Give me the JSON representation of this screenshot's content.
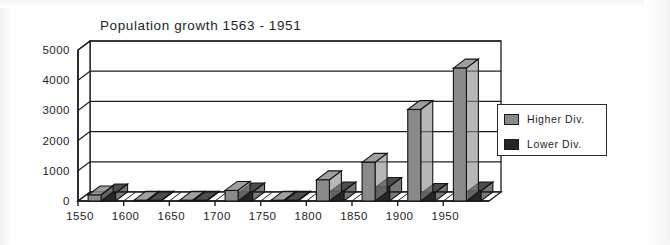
{
  "figure": {
    "background": "#ffffff",
    "width": 670,
    "height": 245
  },
  "chart_data": {
    "type": "bar",
    "title": "Population growth 1563 - 1951",
    "xlabel": "",
    "ylabel": "",
    "categories": [
      "1550",
      "1600",
      "1650",
      "1700",
      "1750",
      "1800",
      "1850",
      "1900",
      "1950"
    ],
    "series": [
      {
        "name": "Higher  Div.",
        "color": "#8a8a8a",
        "values": [
          200,
          20,
          20,
          350,
          20,
          700,
          1280,
          3030,
          4400
        ]
      },
      {
        "name": "Lower  Div.",
        "color": "#252525",
        "values": [
          260,
          20,
          20,
          300,
          20,
          330,
          480,
          280,
          330
        ]
      }
    ],
    "ylim": [
      0,
      5000
    ],
    "yticks": [
      0,
      1000,
      2000,
      3000,
      4000,
      5000
    ],
    "ytick_labels": [
      "0",
      "1000",
      "2000",
      "3000",
      "4000",
      "5000"
    ],
    "xtick_labels": [
      "1550",
      "1600",
      "1650",
      "1700",
      "1750",
      "1800",
      "1850",
      "1900",
      "1950"
    ],
    "grid": true,
    "grid_axis": "y",
    "style": "3d-column",
    "legend_position": "right-outside"
  },
  "legend": {
    "entries": [
      {
        "label": "Higher  Div.",
        "color": "#8a8a8a"
      },
      {
        "label": "Lower  Div.",
        "color": "#252525"
      }
    ]
  },
  "colors": {
    "higher_div": "#8a8a8a",
    "lower_div": "#252525",
    "axis": "#1d1d1d",
    "grid": "#1d1d1d",
    "wall": "#ffffff",
    "floor": "#ffffff",
    "bar_outline": "#141414"
  }
}
